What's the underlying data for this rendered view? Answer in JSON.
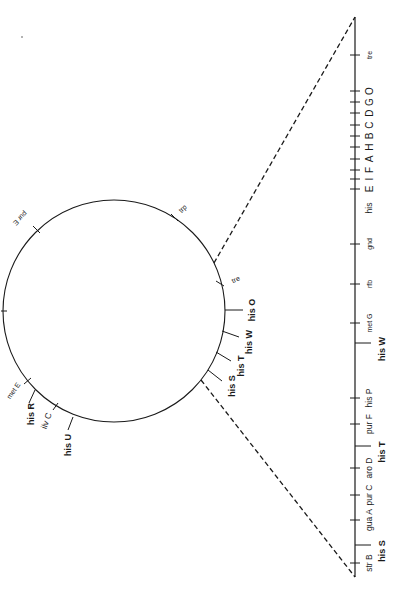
{
  "figure": {
    "background": "#ffffff",
    "ink": "#1a1a1a"
  },
  "circle_map": {
    "center": [
      114,
      311
    ],
    "radius": 111,
    "markers": [
      {
        "label": "pur E",
        "tick": [
          [
            33,
            226
          ],
          [
            40,
            233
          ]
        ],
        "text": [
          20,
          218
        ],
        "rot": 135,
        "style": "sm"
      },
      {
        "label": "trp",
        "tick": [
          [
            171,
            214
          ],
          [
            178,
            221
          ]
        ],
        "text": [
          183,
          209
        ],
        "rot": -45,
        "style": "sm"
      },
      {
        "label": "tre",
        "tick": [
          [
            216,
            281
          ],
          [
            224,
            286
          ]
        ],
        "text": [
          236,
          280
        ],
        "rot": -25,
        "style": "sm"
      },
      {
        "label": "his O",
        "tick": [
          [
            225,
            310
          ],
          [
            243,
            310
          ]
        ],
        "text": [
          253,
          310
        ],
        "rot": -90,
        "style": "bold"
      },
      {
        "label": "his W",
        "tick": [
          [
            222,
            331
          ],
          [
            239,
            337
          ]
        ],
        "text": [
          250,
          342
        ],
        "rot": -90,
        "style": "bold"
      },
      {
        "label": "his T",
        "tick": [
          [
            216,
            352
          ],
          [
            231,
            361
          ]
        ],
        "text": [
          242,
          366
        ],
        "rot": -90,
        "style": "bold"
      },
      {
        "label": "his S",
        "tick": [
          [
            208,
            370
          ],
          [
            222,
            381
          ]
        ],
        "text": [
          233,
          386
        ],
        "rot": -90,
        "style": "bold"
      },
      {
        "label": "met E",
        "tick": [
          [
            24,
            384
          ],
          [
            31,
            378
          ]
        ],
        "text": [
          14,
          391
        ],
        "rot": -55,
        "style": "sm"
      },
      {
        "label": "his R",
        "tick": [
          [
            35,
            390
          ],
          [
            29,
            403
          ]
        ],
        "text": [
          32,
          414
        ],
        "rot": -90,
        "style": "bold"
      },
      {
        "label": "ilv C",
        "tick": [
          [
            53,
            410
          ],
          [
            58,
            403
          ]
        ],
        "text": [
          47,
          421
        ],
        "rot": -70,
        "style": "md"
      },
      {
        "label": "his U",
        "tick": [
          [
            73,
            417
          ],
          [
            68,
            430
          ]
        ],
        "text": [
          69,
          445
        ],
        "rot": -90,
        "style": "bold"
      },
      {
        "label": "",
        "tick": [
          [
            1,
            311
          ],
          [
            7,
            311
          ]
        ],
        "text": [
          0,
          0
        ],
        "rot": 0,
        "style": "sm"
      }
    ]
  },
  "dashed_lines": [
    {
      "from": [
        214,
        263
      ],
      "to": [
        355,
        17
      ]
    },
    {
      "from": [
        201,
        380
      ],
      "to": [
        355,
        577
      ]
    }
  ],
  "linear_map": {
    "x": 355,
    "top": 17,
    "bottom": 577,
    "ticks": [
      {
        "y": 55,
        "label": "tre",
        "label_x": 370,
        "style": "sm",
        "long": false
      },
      {
        "y": 91,
        "label": "O",
        "label_x": 370,
        "style": "letter",
        "long": false
      },
      {
        "y": 102,
        "label": "G",
        "label_x": 370,
        "style": "letter",
        "long": false
      },
      {
        "y": 113,
        "label": "D",
        "label_x": 370,
        "style": "letter",
        "long": false
      },
      {
        "y": 125,
        "label": "C",
        "label_x": 370,
        "style": "letter",
        "long": false
      },
      {
        "y": 136,
        "label": "B",
        "label_x": 370,
        "style": "letter",
        "long": false
      },
      {
        "y": 147,
        "label": "H",
        "label_x": 370,
        "style": "letter",
        "long": false
      },
      {
        "y": 159,
        "label": "A",
        "label_x": 370,
        "style": "letter",
        "long": false
      },
      {
        "y": 170,
        "label": "F",
        "label_x": 370,
        "style": "letter",
        "long": false
      },
      {
        "y": 179,
        "label": "I",
        "label_x": 370,
        "style": "letter",
        "long": false
      },
      {
        "y": 189,
        "label": "E",
        "label_x": 370,
        "style": "letter",
        "long": false
      },
      {
        "y": 244,
        "label": "gnd",
        "label_x": 370,
        "style": "sm",
        "long": false
      },
      {
        "y": 284,
        "label": "rfb",
        "label_x": 370,
        "style": "sm",
        "long": false
      },
      {
        "y": 323,
        "label": "met G",
        "label_x": 370,
        "style": "sm",
        "long": false
      },
      {
        "y": 343,
        "label": "his W",
        "label_x": 383,
        "style": "bold",
        "long": true
      },
      {
        "y": 398,
        "label": "his P",
        "label_x": 370,
        "style": "md",
        "long": false
      },
      {
        "y": 424,
        "label": "pur F",
        "label_x": 370,
        "style": "md",
        "long": false
      },
      {
        "y": 446,
        "label": "his T",
        "label_x": 383,
        "style": "bold",
        "long": true
      },
      {
        "y": 468,
        "label": "aro D",
        "label_x": 370,
        "style": "md",
        "long": false
      },
      {
        "y": 495,
        "label": "pur C",
        "label_x": 370,
        "style": "md",
        "long": false
      },
      {
        "y": 520,
        "label": "gua A",
        "label_x": 370,
        "style": "md",
        "long": false
      },
      {
        "y": 545,
        "label": "his S",
        "label_x": 383,
        "style": "bold",
        "long": true
      },
      {
        "y": 563,
        "label": "str B",
        "label_x": 370,
        "style": "md",
        "long": false
      }
    ],
    "group_labels": [
      {
        "label": "his",
        "x": 370,
        "y": 208,
        "style": "md"
      }
    ]
  },
  "artifacts": [
    {
      "x": 22,
      "y": 37,
      "r": 1
    }
  ]
}
